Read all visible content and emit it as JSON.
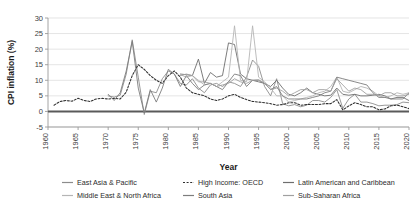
{
  "chart_data": {
    "type": "line",
    "title": "",
    "xlabel": "Year",
    "ylabel": "CPI inflation (%)",
    "xlim": [
      1960,
      2020
    ],
    "ylim": [
      -5,
      30
    ],
    "ytick_step": 5,
    "xtick_step": 5,
    "xticks": [
      "1960",
      "1965",
      "1970",
      "1975",
      "1980",
      "1985",
      "1990",
      "1995",
      "2000",
      "2005",
      "2010",
      "2015",
      "2020"
    ],
    "yticks": [
      "-5",
      "0",
      "5",
      "10",
      "15",
      "20",
      "25",
      "30"
    ],
    "grid": "horizontal",
    "legend_position": "bottom",
    "x": [
      1960,
      1961,
      1962,
      1963,
      1964,
      1965,
      1966,
      1967,
      1968,
      1969,
      1970,
      1971,
      1972,
      1973,
      1974,
      1975,
      1976,
      1977,
      1978,
      1979,
      1980,
      1981,
      1982,
      1983,
      1984,
      1985,
      1986,
      1987,
      1988,
      1989,
      1990,
      1991,
      1992,
      1993,
      1994,
      1995,
      1996,
      1997,
      1998,
      1999,
      2000,
      2001,
      2002,
      2003,
      2004,
      2005,
      2006,
      2007,
      2008,
      2009,
      2010,
      2011,
      2012,
      2013,
      2014,
      2015,
      2016,
      2017,
      2018,
      2019,
      2020
    ],
    "series": [
      {
        "name": "East Asia & Pacific",
        "color": "#8c8c8c",
        "dash": "none",
        "width": 0.9,
        "values": [
          null,
          null,
          null,
          null,
          null,
          null,
          null,
          null,
          null,
          null,
          5.0,
          4.6,
          5.2,
          12.0,
          23.0,
          11.0,
          -1.0,
          6.5,
          6.0,
          10.5,
          13.0,
          12.0,
          9.0,
          8.5,
          10.5,
          7.5,
          6.0,
          8.5,
          9.0,
          8.0,
          9.5,
          9.0,
          8.0,
          11.0,
          16.5,
          14.5,
          8.0,
          5.0,
          10.5,
          2.5,
          1.8,
          2.2,
          1.5,
          2.0,
          3.5,
          3.5,
          3.0,
          4.5,
          7.0,
          1.0,
          4.0,
          5.5,
          3.0,
          3.0,
          2.5,
          1.8,
          2.0,
          2.0,
          2.2,
          3.0,
          2.8
        ]
      },
      {
        "name": "High Income: OECD",
        "color": "#2f2f2f",
        "dash": "2,1.6",
        "width": 1.05,
        "values": [
          null,
          2.0,
          3.2,
          3.5,
          3.3,
          4.2,
          3.5,
          3.2,
          4.0,
          4.2,
          4.0,
          4.2,
          4.0,
          6.2,
          11.5,
          15.0,
          13.5,
          11.5,
          10.0,
          9.0,
          11.5,
          13.0,
          11.0,
          7.5,
          6.0,
          5.5,
          5.0,
          4.0,
          3.5,
          4.0,
          5.0,
          5.5,
          4.5,
          3.8,
          3.2,
          3.0,
          2.8,
          2.5,
          2.0,
          2.2,
          2.8,
          2.8,
          2.0,
          2.2,
          2.2,
          2.2,
          2.5,
          2.5,
          3.8,
          0.5,
          1.8,
          2.8,
          2.2,
          1.5,
          1.5,
          0.5,
          0.8,
          1.8,
          2.0,
          1.5,
          0.9
        ]
      },
      {
        "name": "Latin American and Caribbean",
        "color": "#6e6e6e",
        "dash": "none",
        "width": 0.9,
        "values": [
          null,
          null,
          null,
          null,
          null,
          null,
          null,
          null,
          null,
          null,
          null,
          null,
          null,
          null,
          null,
          null,
          null,
          null,
          null,
          null,
          null,
          null,
          12.0,
          11.8,
          11.5,
          16.8,
          9.0,
          12.5,
          11.0,
          11.5,
          22.0,
          21.5,
          12.0,
          10.5,
          10.0,
          9.5,
          9.0,
          8.0,
          10.0,
          7.5,
          5.5,
          5.0,
          6.0,
          7.5,
          6.0,
          5.5,
          5.0,
          5.2,
          7.5,
          5.5,
          5.2,
          5.5,
          5.0,
          5.0,
          5.2,
          5.5,
          5.0,
          4.0,
          4.5,
          4.5,
          3.5
        ]
      },
      {
        "name": "Middle East & North Africa",
        "color": "#b5b5b5",
        "dash": "none",
        "width": 0.9,
        "values": [
          null,
          null,
          null,
          null,
          null,
          null,
          null,
          null,
          null,
          null,
          null,
          null,
          null,
          null,
          null,
          null,
          null,
          null,
          null,
          null,
          null,
          null,
          11.8,
          11.0,
          11.5,
          10.0,
          8.5,
          9.0,
          8.0,
          9.5,
          11.0,
          27.5,
          10.0,
          9.5,
          27.5,
          11.0,
          9.5,
          7.5,
          5.0,
          5.0,
          3.0,
          3.5,
          4.0,
          4.5,
          5.0,
          6.0,
          6.5,
          8.0,
          11.0,
          6.5,
          6.0,
          7.0,
          8.0,
          7.5,
          6.5,
          5.0,
          4.5,
          5.0,
          6.0,
          5.5,
          6.0
        ]
      },
      {
        "name": "South Asia",
        "color": "#7d7d7d",
        "dash": "none",
        "width": 0.9,
        "values": [
          null,
          null,
          null,
          null,
          null,
          null,
          null,
          null,
          null,
          null,
          5.5,
          3.5,
          6.0,
          13.0,
          22.5,
          7.5,
          -0.5,
          7.0,
          3.0,
          7.5,
          13.5,
          12.0,
          8.0,
          11.5,
          9.0,
          7.0,
          8.5,
          9.0,
          8.0,
          7.0,
          9.5,
          12.0,
          11.5,
          8.0,
          10.0,
          10.0,
          9.0,
          7.0,
          8.0,
          5.0,
          4.0,
          4.0,
          4.0,
          4.0,
          4.5,
          5.0,
          6.0,
          6.5,
          11.0,
          10.5,
          10.0,
          9.5,
          9.0,
          8.5,
          6.0,
          4.5,
          4.5,
          4.0,
          4.0,
          4.0,
          6.0
        ]
      },
      {
        "name": "Sub-Saharan Africa",
        "color": "#a0a0a0",
        "dash": "none",
        "width": 0.9,
        "values": [
          null,
          null,
          null,
          null,
          null,
          null,
          null,
          null,
          null,
          null,
          null,
          null,
          null,
          null,
          null,
          null,
          null,
          null,
          null,
          null,
          null,
          null,
          11.5,
          12.0,
          11.5,
          9.5,
          9.5,
          9.0,
          8.0,
          8.5,
          9.0,
          10.5,
          9.5,
          9.0,
          10.0,
          10.2,
          9.0,
          7.0,
          7.5,
          6.5,
          5.0,
          6.0,
          7.0,
          7.0,
          6.0,
          7.0,
          7.0,
          6.5,
          10.5,
          8.5,
          6.5,
          7.5,
          7.0,
          5.5,
          5.5,
          5.0,
          6.0,
          6.0,
          5.0,
          5.0,
          5.5
        ]
      }
    ]
  },
  "legend": {
    "items": [
      {
        "label": "East Asia & Pacific"
      },
      {
        "label": "High Income: OECD"
      },
      {
        "label": "Latin American and Caribbean"
      },
      {
        "label": "Middle East & North Africa"
      },
      {
        "label": "South Asia"
      },
      {
        "label": "Sub-Saharan Africa"
      }
    ]
  }
}
